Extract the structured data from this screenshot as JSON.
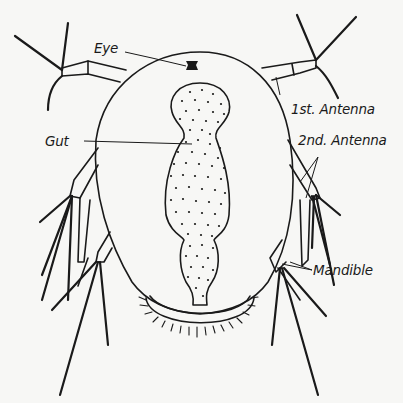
{
  "figure": {
    "background_color": "#f7f7f5",
    "ink_color": "#1a1a1a"
  },
  "labels": {
    "eye": "Eye",
    "first_antenna": "1st. Antenna",
    "gut": "Gut",
    "second_antenna": "2nd. Antenna",
    "mandible": "Mandible"
  }
}
